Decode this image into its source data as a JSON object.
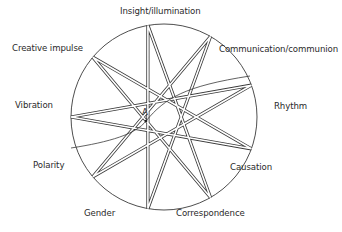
{
  "diagram": {
    "type": "nine-pointed star (enneagram) inscribed in circle",
    "center": [
      164,
      117
    ],
    "radius": 93,
    "star_step": 4,
    "start_angle_deg": -100,
    "line_color": "#3a3a3a",
    "labels": [
      {
        "id": "insight",
        "text": "Insight/illumination",
        "x": 120,
        "y": 7
      },
      {
        "id": "communication",
        "text": "Communication/communion",
        "x": 219,
        "y": 45
      },
      {
        "id": "rhythm",
        "text": "Rhythm",
        "x": 274,
        "y": 102
      },
      {
        "id": "causation",
        "text": "Causation",
        "x": 230,
        "y": 163
      },
      {
        "id": "correspondence",
        "text": "Correspondence",
        "x": 176,
        "y": 209
      },
      {
        "id": "gender",
        "text": "Gender",
        "x": 84,
        "y": 209
      },
      {
        "id": "polarity",
        "text": "Polarity",
        "x": 33,
        "y": 161
      },
      {
        "id": "vibration",
        "text": "Vibration",
        "x": 15,
        "y": 101
      },
      {
        "id": "creative-impulse",
        "text": "Creative impulse",
        "x": 12,
        "y": 44
      }
    ],
    "point_a": {
      "label": "A",
      "x": 146,
      "y": 121
    }
  }
}
